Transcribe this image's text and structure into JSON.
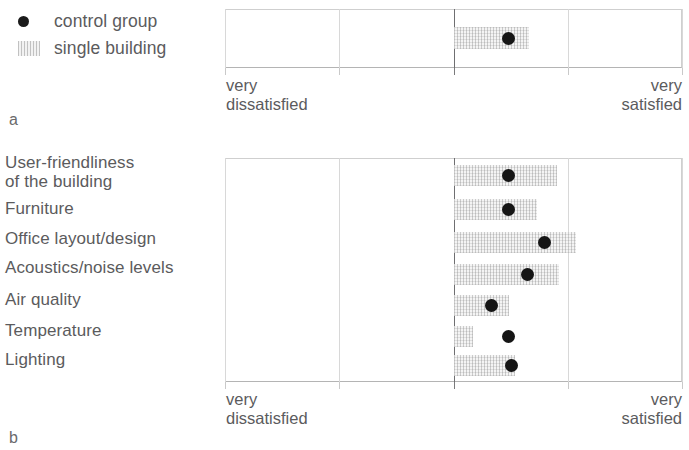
{
  "legend": {
    "items": [
      {
        "label": "control group",
        "marker": "filled-circle-marker"
      },
      {
        "label": "single building",
        "marker": "hatched-band-marker"
      }
    ]
  },
  "panels": [
    {
      "letter": "a"
    },
    {
      "letter": "b"
    }
  ],
  "axis": {
    "left_caption": "very\ndissatisfied",
    "right_caption": "very\nsatisfied"
  },
  "colors": {
    "dot": "#151515",
    "hatch": "#f4f4f4",
    "grid": "#d8d8d8",
    "center_axis": "#6f6f71",
    "text": "#5b5b5d"
  },
  "chart_data": [
    {
      "id": "panel-a",
      "type": "scatter",
      "title": "",
      "xlabel": "",
      "ylabel": "",
      "xlim": [
        1,
        5
      ],
      "xticks": [
        1,
        2,
        3,
        4,
        5
      ],
      "xtick_labels": [
        "very dissatisfied",
        "",
        "",
        "",
        "very satisfied"
      ],
      "grid": true,
      "center_line_at": 3,
      "legend_position": "outside-top-left",
      "categories": [
        "overall satisfaction"
      ],
      "series": [
        {
          "name": "control group",
          "values": [
            3.48
          ]
        },
        {
          "name": "single building",
          "kind": "range-band",
          "ranges": [
            [
              3.0,
              3.66
            ]
          ]
        }
      ]
    },
    {
      "id": "panel-b",
      "type": "scatter",
      "title": "",
      "xlabel": "",
      "ylabel": "",
      "xlim": [
        1,
        5
      ],
      "xticks": [
        1,
        2,
        3,
        4,
        5
      ],
      "xtick_labels": [
        "very dissatisfied",
        "",
        "",
        "",
        "very satisfied"
      ],
      "grid": true,
      "center_line_at": 3,
      "categories": [
        "User-friendliness\nof the building",
        "Furniture",
        "Office layout/design",
        "Acoustics/noise levels",
        "Air quality",
        "Temperature",
        "Lighting"
      ],
      "series": [
        {
          "name": "control group",
          "values": [
            3.48,
            3.48,
            3.8,
            3.65,
            3.33,
            3.48,
            3.51
          ]
        },
        {
          "name": "single building",
          "kind": "range-band",
          "ranges": [
            [
              3.0,
              3.9
            ],
            [
              3.0,
              3.73
            ],
            [
              3.0,
              4.07
            ],
            [
              3.0,
              3.92
            ],
            [
              3.0,
              3.48
            ],
            [
              3.0,
              3.17
            ],
            [
              3.0,
              3.53
            ]
          ]
        }
      ]
    }
  ]
}
